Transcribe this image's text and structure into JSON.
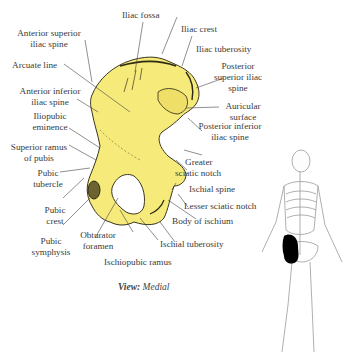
{
  "diagram": {
    "bone_color": "#f6ea7a",
    "bone_shadow_color": "#2b2a12",
    "highlight_color": "#000000",
    "caption": {
      "label": "View:",
      "value": "Medial"
    },
    "labels": {
      "iliac_fossa": "Iliac fossa",
      "iliac_crest": "Iliac crest",
      "iliac_tuberosity": "Iliac tuberosity",
      "asis_1": "Anterior superior",
      "asis_2": "iliac spine",
      "arcuate_line": "Arcuate line",
      "aiis_1": "Anterior inferior",
      "aiis_2": "iliac spine",
      "iliopubic_1": "Iliopubic",
      "iliopubic_2": "eminence",
      "sup_ramus_1": "Superior ramus",
      "sup_ramus_2": "of pubis",
      "pubic_tubercle_1": "Pubic",
      "pubic_tubercle_2": "tubercle",
      "pubic_crest_1": "Pubic",
      "pubic_crest_2": "crest",
      "pubic_symphysis_1": "Pubic",
      "pubic_symphysis_2": "symphysis",
      "obturator_1": "Obturator",
      "obturator_2": "foramen",
      "ischiopubic_ramus": "Ischiopubic ramus",
      "ischial_tuberosity": "Ischial tuberosity",
      "body_ischium": "Body of ischium",
      "lesser_sciatic": "Lesser sciatic notch",
      "ischial_spine": "Ischial spine",
      "greater_sciatic_1": "Greater",
      "greater_sciatic_2": "sciatic notch",
      "piis_1": "Posterior inferior",
      "piis_2": "iliac spine",
      "auricular_1": "Auricular",
      "auricular_2": "surface",
      "psis_1": "Posterior",
      "psis_2": "superior iliac",
      "psis_3": "spine"
    }
  }
}
